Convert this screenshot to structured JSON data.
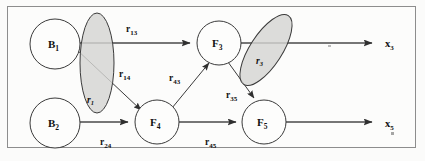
{
  "figure": {
    "type": "signal-flow-graph",
    "title": "",
    "background_color": "#fbfbfa",
    "frame_color": "#8d8d8d",
    "ellipse_fill": "#d4d4d2",
    "line_color": "#4a4a4a"
  },
  "nodes": [
    {
      "id": "B1",
      "base": "B",
      "sub": "1",
      "x": 55,
      "y": 44,
      "r": 25,
      "role": "source"
    },
    {
      "id": "B2",
      "base": "B",
      "sub": "2",
      "x": 55,
      "y": 123,
      "r": 25,
      "role": "source"
    },
    {
      "id": "F3",
      "base": "F",
      "sub": "3",
      "x": 219,
      "y": 43,
      "r": 22,
      "role": "flux"
    },
    {
      "id": "F4",
      "base": "F",
      "sub": "4",
      "x": 157,
      "y": 122,
      "r": 22,
      "role": "flux"
    },
    {
      "id": "F5",
      "base": "F",
      "sub": "5",
      "x": 264,
      "y": 122,
      "r": 22,
      "role": "flux"
    }
  ],
  "edges": [
    {
      "id": "r13",
      "base": "r",
      "sub": "13",
      "from": "B1",
      "to": "F3",
      "label_x": 131,
      "label_y": 30
    },
    {
      "id": "r14",
      "base": "r",
      "sub": "14",
      "from": "B1",
      "to": "F4",
      "label_x": 124,
      "label_y": 75
    },
    {
      "id": "r24",
      "base": "r",
      "sub": "24",
      "from": "B2",
      "to": "F4",
      "label_x": 107,
      "label_y": 143
    },
    {
      "id": "r43",
      "base": "r",
      "sub": "43",
      "from": "F4",
      "to": "F3",
      "label_x": 176,
      "label_y": 79
    },
    {
      "id": "r45",
      "base": "r",
      "sub": "45",
      "from": "F4",
      "to": "F5",
      "label_x": 212,
      "label_y": 143
    },
    {
      "id": "r35",
      "base": "r",
      "sub": "35",
      "from": "F3",
      "to": "F5",
      "label_x": 232,
      "label_y": 96
    }
  ],
  "outputs": [
    {
      "id": "x3",
      "base": "x",
      "sub": "3",
      "from": "F3",
      "label_x": 388,
      "label_y": 46
    },
    {
      "id": "x5",
      "base": "x",
      "sub": "5",
      "from": "F5",
      "label_x": 388,
      "label_y": 126
    }
  ],
  "ellipses": [
    {
      "id": "r1",
      "base": "r",
      "sub": "1",
      "cx": 97,
      "cy": 63,
      "rx": 17,
      "ry": 50,
      "rotation": 0,
      "label_x": 91,
      "label_y": 101
    },
    {
      "id": "r3",
      "base": "r",
      "sub": "3",
      "cx": 266,
      "cy": 50,
      "rx": 16,
      "ry": 41,
      "rotation": 33,
      "label_x": 259,
      "label_y": 62
    }
  ],
  "icon_names": [
    "node-circle-icon",
    "arrow-head-icon",
    "ellipse-highlight-icon"
  ]
}
